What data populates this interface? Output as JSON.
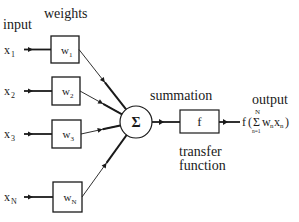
{
  "labels": {
    "input": "input",
    "weights": "weights",
    "summation": "summation",
    "summation_symbol": "Σ",
    "transfer_symbol": "f",
    "transfer_line1": "transfer",
    "transfer_line2": "function",
    "output": "output"
  },
  "inputs": [
    {
      "var": "x",
      "sub": "1",
      "weight": "w",
      "wsub": "1"
    },
    {
      "var": "x",
      "sub": "2",
      "weight": "w",
      "wsub": "2"
    },
    {
      "var": "x",
      "sub": "3",
      "weight": "w",
      "wsub": "3"
    },
    {
      "var": "x",
      "sub": "N",
      "weight": "w",
      "wsub": "N"
    }
  ],
  "formula": {
    "f": "f",
    "open": "(",
    "sigma": "Σ",
    "upper": "N",
    "lower": "n=1",
    "term": "w",
    "term_sub": "n",
    "term2": "x",
    "term2_sub": "n",
    "close": ")"
  }
}
